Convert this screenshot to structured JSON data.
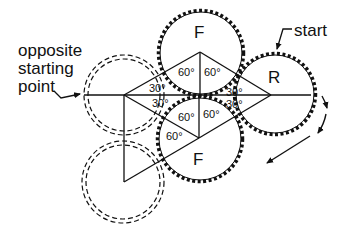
{
  "diagram": {
    "labels": {
      "opposite_line1": "opposite",
      "opposite_line2": "starting",
      "opposite_line3": "point",
      "start": "start"
    },
    "gears": [
      {
        "id": "front-top",
        "label": "F",
        "style": "toothed"
      },
      {
        "id": "front-bottom",
        "label": "F",
        "style": "toothed"
      },
      {
        "id": "rear",
        "label": "R",
        "style": "toothed"
      },
      {
        "id": "ghost-upper",
        "label": "",
        "style": "dashed"
      },
      {
        "id": "ghost-lower",
        "label": "",
        "style": "dashed"
      }
    ],
    "angles": {
      "top_left": "60°",
      "top_right": "60°",
      "bottom_left_upper": "60°",
      "bottom_right_upper": "60°",
      "bottom_left_lower": "60°",
      "left_upper": "30°",
      "left_lower": "30°",
      "right_upper": "30°",
      "right_lower": "30°"
    },
    "colors": {
      "ink": "#111111",
      "background": "#ffffff"
    }
  }
}
